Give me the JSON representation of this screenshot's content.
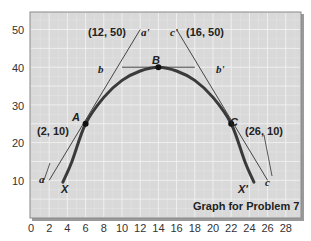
{
  "chart_data": {
    "type": "line",
    "title": "Graph for Problem 7",
    "xlabel": "",
    "ylabel": "",
    "xlim": [
      0,
      29
    ],
    "ylim": [
      0,
      55
    ],
    "grid": true,
    "x_ticks": [
      0,
      2,
      4,
      6,
      8,
      10,
      12,
      14,
      16,
      18,
      20,
      22,
      24,
      26,
      28
    ],
    "y_ticks": [
      10,
      20,
      30,
      40,
      50
    ],
    "series": [
      {
        "name": "Curve XX'",
        "kind": "curve",
        "points": [
          [
            3.5,
            9.5
          ],
          [
            4.5,
            15
          ],
          [
            6,
            25
          ],
          [
            8,
            32
          ],
          [
            10,
            36.5
          ],
          [
            12,
            39
          ],
          [
            14,
            40
          ],
          [
            16,
            39
          ],
          [
            18,
            36.5
          ],
          [
            20,
            32
          ],
          [
            22,
            25
          ],
          [
            23.5,
            15
          ],
          [
            24.5,
            9.5
          ]
        ]
      },
      {
        "name": "Tangent aa'",
        "kind": "line",
        "points": [
          [
            2,
            10
          ],
          [
            12,
            50
          ]
        ]
      },
      {
        "name": "Tangent bb'",
        "kind": "line",
        "points": [
          [
            10,
            40
          ],
          [
            18,
            40
          ]
        ]
      },
      {
        "name": "Tangent cc'",
        "kind": "line",
        "points": [
          [
            16,
            50
          ],
          [
            26,
            10
          ]
        ]
      }
    ],
    "points": [
      {
        "label": "A",
        "x": 6,
        "y": 25
      },
      {
        "label": "B",
        "x": 14,
        "y": 40
      },
      {
        "label": "C",
        "x": 22,
        "y": 25
      }
    ],
    "annotations": [
      {
        "text": "(12, 50)",
        "x": 12,
        "y": 50
      },
      {
        "text": "(16, 50)",
        "x": 16,
        "y": 50
      },
      {
        "text": "(2, 10)",
        "x": 2,
        "y": 10
      },
      {
        "text": "(26, 10)",
        "x": 26,
        "y": 10
      },
      {
        "text": "a",
        "x": 2,
        "y": 10
      },
      {
        "text": "a'",
        "x": 12,
        "y": 50
      },
      {
        "text": "b",
        "x": 10,
        "y": 40
      },
      {
        "text": "b'",
        "x": 18,
        "y": 40
      },
      {
        "text": "c",
        "x": 26,
        "y": 10
      },
      {
        "text": "c'",
        "x": 16,
        "y": 50
      },
      {
        "text": "X",
        "x": 4,
        "y": 7
      },
      {
        "text": "X'",
        "x": 24,
        "y": 7
      }
    ]
  },
  "labels": {
    "caption": "Graph for Problem 7",
    "coord_12_50": "(12, 50)",
    "coord_16_50": "(16, 50)",
    "coord_2_10": "(2, 10)",
    "coord_26_10": "(26, 10)",
    "a": "a",
    "a_prime": "a'",
    "b": "b",
    "b_prime": "b'",
    "c": "c",
    "c_prime": "c'",
    "A": "A",
    "B": "B",
    "C": "C",
    "X": "X",
    "X_prime": "X'"
  },
  "ticks": {
    "x": [
      "0",
      "2",
      "4",
      "6",
      "8",
      "10",
      "12",
      "14",
      "16",
      "18",
      "20",
      "22",
      "24",
      "26",
      "28"
    ],
    "y": [
      "50",
      "40",
      "30",
      "20",
      "10"
    ]
  },
  "colors": {
    "plot_bg": "#d9d9d9",
    "grid": "#f2f2f2",
    "curve": "#3a3a3a",
    "line": "#333333",
    "text": "#222222"
  }
}
